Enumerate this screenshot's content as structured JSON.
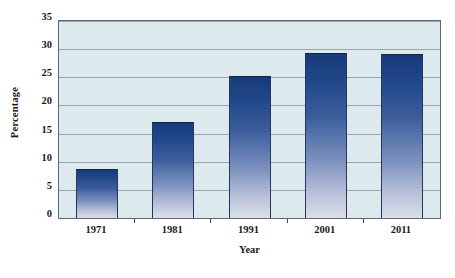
{
  "chart_data": {
    "type": "bar",
    "title": "",
    "subtitle": "",
    "xlabel": "Year",
    "ylabel": "Percentage",
    "categories": [
      "1971",
      "1981",
      "1991",
      "2001",
      "2011"
    ],
    "values": [
      8.7,
      17.0,
      25.3,
      29.4,
      29.2
    ],
    "series": [
      {
        "name": "Percentage",
        "values": [
          8.7,
          17.0,
          25.3,
          29.4,
          29.2
        ]
      }
    ],
    "ylim": [
      0,
      35
    ],
    "yticks": [
      0,
      5,
      10,
      15,
      20,
      25,
      30,
      35
    ],
    "ytick_labels": [
      "0",
      "5",
      "10",
      "15",
      "20",
      "25",
      "30",
      "35"
    ],
    "grid": true,
    "grid_axis": "y",
    "legend": false,
    "legend_position": "none",
    "annotations": [],
    "colors": {
      "plot_background": "#dce9ed",
      "figure_background": "#ffffff",
      "bar_gradient_top": "#173a78",
      "bar_gradient_bottom": "#dcdfe9",
      "gridline": "#8c9aa0",
      "axis_border": "#5b6a74",
      "text": "#1a1a1a"
    }
  }
}
